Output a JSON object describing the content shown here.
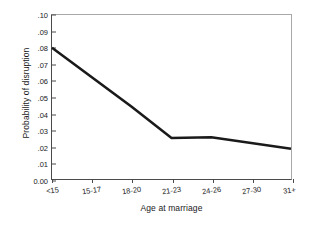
{
  "chart_data": {
    "type": "line",
    "title": "",
    "subtitle": "",
    "xlabel": "Age at marriage",
    "ylabel": "Probability of disruption",
    "categories": [
      "<15",
      "15-17",
      "18-20",
      "21-23",
      "24-26",
      "27-30",
      "31+"
    ],
    "series": [
      {
        "name": "Probability of disruption",
        "values": [
          0.08,
          0.062,
          0.044,
          0.025,
          0.0255,
          0.022,
          0.0185
        ],
        "color": "#1a1a1a"
      }
    ],
    "ylim": [
      0.0,
      0.1
    ],
    "xlim_categories": 7,
    "y_ticks": [
      0.0,
      0.01,
      0.02,
      0.03,
      0.04,
      0.05,
      0.06,
      0.07,
      0.08,
      0.09,
      0.1
    ],
    "y_tick_labels": [
      "0.00",
      ".01",
      ".02",
      ".03",
      ".04",
      ".05",
      ".06",
      ".07",
      ".08",
      ".09",
      ".10"
    ],
    "grid": false,
    "legend": false,
    "legend_position": "none",
    "annotations": []
  },
  "axes": {
    "y_title": "Probability of disruption",
    "x_title": "Age at marriage"
  },
  "style": {
    "line_color": "#1a1a1a",
    "frame_color_dark": "#4a4a4a",
    "frame_color_light": "#a8a8a8",
    "background": "#ffffff",
    "text_color": "#1a1a1a"
  }
}
